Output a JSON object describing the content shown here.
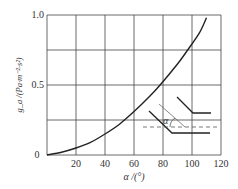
{
  "chart_data": {
    "type": "line",
    "title": "",
    "xlabel": "α /(°)",
    "ylabel": "g_a /(Pa·m⁻²·s²)",
    "xlim": [
      0,
      120
    ],
    "ylim": [
      0,
      1.0
    ],
    "x_ticks": [
      "0",
      "20",
      "40",
      "60",
      "80",
      "100",
      "120"
    ],
    "y_ticks": [
      "0",
      "0.5",
      "1.0"
    ],
    "grid": true,
    "series": [
      {
        "name": "g_a",
        "x": [
          0,
          10,
          20,
          30,
          40,
          50,
          60,
          70,
          78,
          90,
          97,
          105,
          110
        ],
        "y": [
          0,
          0.02,
          0.05,
          0.09,
          0.15,
          0.22,
          0.31,
          0.41,
          0.5,
          0.65,
          0.75,
          0.87,
          0.98
        ]
      }
    ],
    "inset": {
      "label": "α",
      "description": "bend geometry sketch showing angle α between inclined duct wall and horizontal dashed reference"
    }
  }
}
